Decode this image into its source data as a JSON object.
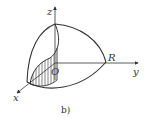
{
  "diagram": {
    "type": "3d-octant-sphere-with-cylinder",
    "labels": {
      "z_axis": "z",
      "y_axis": "y",
      "x_axis": "x",
      "origin": "O",
      "radius": "R"
    },
    "caption": "b)",
    "colors": {
      "stroke": "#333333",
      "background": "#ffffff"
    }
  }
}
